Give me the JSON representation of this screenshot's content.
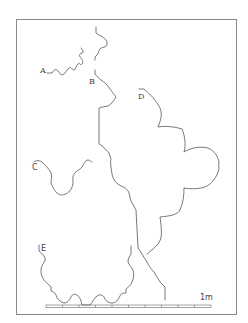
{
  "figure": {
    "profiles": [
      {
        "id": "A",
        "label": "A"
      },
      {
        "id": "B",
        "label": "B"
      },
      {
        "id": "C",
        "label": "C"
      },
      {
        "id": "D",
        "label": "D"
      },
      {
        "id": "E",
        "label": "E"
      }
    ],
    "scale_bar": {
      "label": "1m",
      "divisions": 10
    },
    "colors": {
      "line": "#555555",
      "frame": "#8a8a8a",
      "background": "#ffffff"
    }
  }
}
